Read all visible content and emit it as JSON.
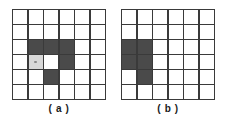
{
  "figure": {
    "background_color": "#ffffff",
    "grid_line_color": "#3a3a3a",
    "fill_color": "#4a4a4a",
    "soft_fill_color": "#d8d8d8",
    "empty_color": "#ffffff",
    "rows": 6,
    "cols": 6
  },
  "panels": [
    {
      "id": "a",
      "caption": "( a )",
      "cells": [
        [
          "empty",
          "empty",
          "empty",
          "empty",
          "empty",
          "empty"
        ],
        [
          "empty",
          "empty",
          "empty",
          "empty",
          "empty",
          "empty"
        ],
        [
          "empty",
          "filled",
          "filled",
          "filled",
          "empty",
          "empty"
        ],
        [
          "empty",
          "soft",
          "empty",
          "filled",
          "empty",
          "empty"
        ],
        [
          "empty",
          "empty",
          "filled",
          "empty",
          "empty",
          "empty"
        ],
        [
          "empty",
          "empty",
          "empty",
          "empty",
          "empty",
          "empty"
        ]
      ]
    },
    {
      "id": "b",
      "caption": "( b )",
      "cells": [
        [
          "empty",
          "empty",
          "empty",
          "empty",
          "empty",
          "empty"
        ],
        [
          "empty",
          "empty",
          "empty",
          "empty",
          "empty",
          "empty"
        ],
        [
          "filled",
          "filled",
          "empty",
          "empty",
          "empty",
          "empty"
        ],
        [
          "filled",
          "filled",
          "empty",
          "empty",
          "empty",
          "empty"
        ],
        [
          "empty",
          "filled",
          "empty",
          "empty",
          "empty",
          "empty"
        ],
        [
          "empty",
          "empty",
          "empty",
          "empty",
          "empty",
          "empty"
        ]
      ]
    }
  ]
}
